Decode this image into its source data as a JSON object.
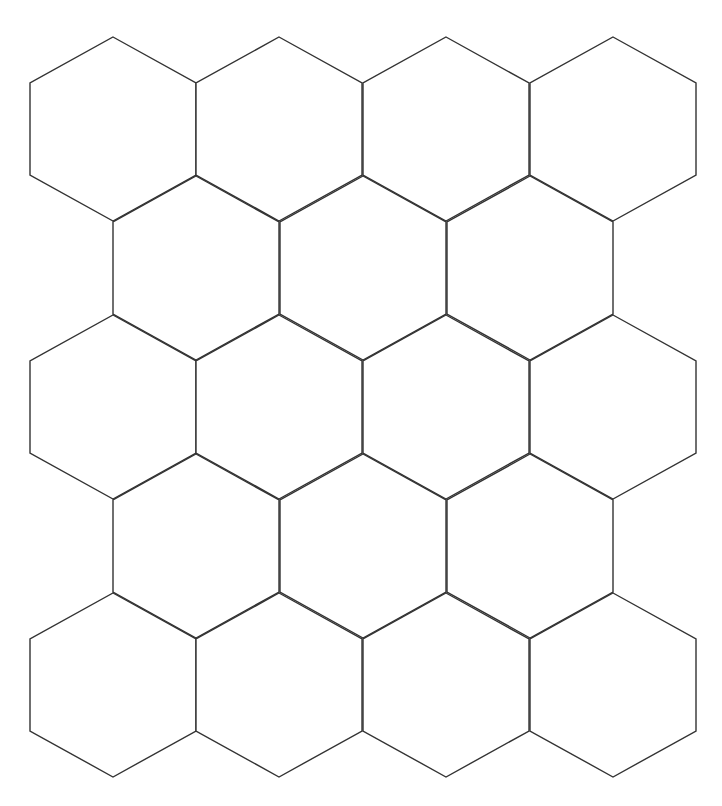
{
  "canvas": {
    "width": 722,
    "height": 806,
    "background": "#ffffff"
  },
  "header": {
    "clipped_text": ""
  },
  "grid": {
    "stroke_color": "#333333",
    "fill_color": "#ffffff",
    "hex_width": 166,
    "hex_height": 184,
    "row_count": 5,
    "rows": [
      {
        "top": 37,
        "centers_x": [
          113,
          279,
          446,
          613
        ]
      },
      {
        "top": 176,
        "centers_x": [
          196,
          363,
          530
        ]
      },
      {
        "top": 315,
        "centers_x": [
          113,
          279,
          446,
          613
        ]
      },
      {
        "top": 454,
        "centers_x": [
          196,
          363,
          530
        ]
      },
      {
        "top": 593,
        "centers_x": [
          113,
          279,
          446,
          613
        ]
      }
    ],
    "total_hexagons": 18
  }
}
